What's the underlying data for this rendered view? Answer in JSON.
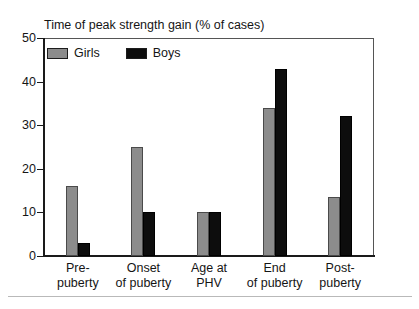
{
  "chart_data": {
    "type": "bar",
    "title": "Time of peak strength gain (% of cases)",
    "xlabel": "",
    "ylabel": "",
    "ylim": [
      0,
      50
    ],
    "yticks": [
      0,
      10,
      20,
      30,
      40,
      50
    ],
    "grid": false,
    "legend_position": "top-left",
    "categories": [
      "Pre-puberty",
      "Onset of puberty",
      "Age at PHV",
      "End of puberty",
      "Post-puberty"
    ],
    "category_lines": [
      {
        "line1": "Pre-",
        "line2": "puberty"
      },
      {
        "line1": "Onset",
        "line2": "of puberty"
      },
      {
        "line1": "Age at",
        "line2": "PHV"
      },
      {
        "line1": "End",
        "line2": "of puberty"
      },
      {
        "line1": "Post-",
        "line2": "puberty"
      }
    ],
    "series": [
      {
        "name": "Girls",
        "color": "#8c8c8c",
        "values": [
          16,
          25,
          10,
          34,
          13.5
        ]
      },
      {
        "name": "Boys",
        "color": "#0d0d0d",
        "values": [
          3,
          10,
          10,
          43,
          32
        ]
      }
    ]
  },
  "axis": {
    "y_tick_labels": [
      "50",
      "40",
      "30",
      "20",
      "10",
      "0"
    ]
  },
  "legend": {
    "items": [
      {
        "label": "Girls",
        "color": "#8c8c8c"
      },
      {
        "label": "Boys",
        "color": "#0d0d0d"
      }
    ]
  }
}
